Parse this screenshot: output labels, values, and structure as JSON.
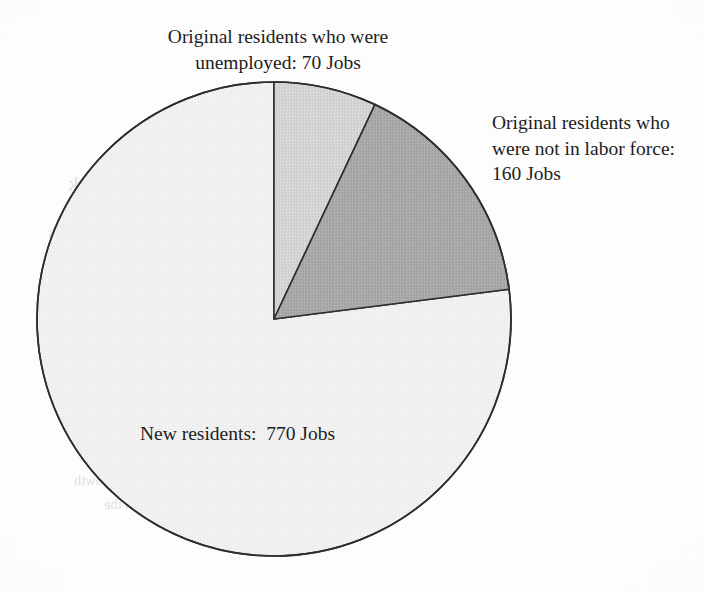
{
  "chart_data": {
    "type": "pie",
    "title": "",
    "units": "Jobs",
    "total": 1000,
    "start_angle_deg": 0,
    "direction": "clockwise",
    "legend": "none",
    "labels_outside": true,
    "categories": [
      "Original residents who were unemployed",
      "Original residents who were not in labor force",
      "New residents"
    ],
    "values": [
      70,
      160,
      770
    ],
    "slices": [
      {
        "name": "original-residents-unemployed",
        "category": "Original residents who were unemployed",
        "value": 70,
        "unit": "Jobs",
        "percent": 7.0,
        "sweep_deg": 25.2,
        "start_deg": 0,
        "end_deg": 25.2,
        "color": "#d4d4d4",
        "stroke": "#2e2e2e"
      },
      {
        "name": "original-residents-not-in-labor-force",
        "category": "Original residents who were not in labor force",
        "value": 160,
        "unit": "Jobs",
        "percent": 16.0,
        "sweep_deg": 57.6,
        "start_deg": 25.2,
        "end_deg": 82.8,
        "color": "#a9a9a9",
        "stroke": "#2e2e2e"
      },
      {
        "name": "new-residents",
        "category": "New residents",
        "value": 770,
        "unit": "Jobs",
        "percent": 77.0,
        "sweep_deg": 277.2,
        "start_deg": 82.8,
        "end_deg": 360,
        "color": "#f2f2f2",
        "stroke": "#2e2e2e"
      }
    ],
    "data_labels": [
      "Original residents who were\nunemployed: 70 Jobs",
      "Original residents who\nwere not in labor force:\n160 Jobs",
      "New residents:  770 Jobs"
    ]
  },
  "labels": {
    "unemployed": "Original residents who were\nunemployed: 70 Jobs",
    "not_in_labor_force": "Original residents who\nwere not in labor force:\n160 Jobs",
    "new_residents": "New residents:  770 Jobs"
  },
  "geometry": {
    "center_x": 274,
    "center_y": 319,
    "radius": 237
  },
  "colors": {
    "slice_unemployed": "#d4d4d4",
    "slice_not_in_labor_force": "#a9a9a9",
    "slice_new_residents": "#f2f2f2",
    "outline": "#2e2e2e",
    "page_background": "#fefefe",
    "text": "#1d1d1d"
  },
  "bleed_through": {
    "note": "faint mirrored text showing through from the reverse side of the scanned page",
    "lines": [
      "Transformations",
      "Manufacturing in New York",
      "industries became an industry in New York",
      "developed into a diversified city",
      "the local industries and small shops in the",
      "resident one to one. The production continues",
      "the hand of the manufacturer, smaller in",
      "numbers of firms. Manufacturing in the",
      "industry was the principal means of growth",
      "for the New York labor market in the",
      "period of the 1960s"
    ]
  }
}
